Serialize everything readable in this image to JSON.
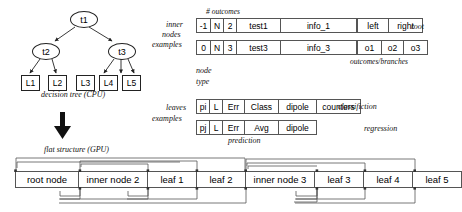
{
  "diagram": {
    "tree": {
      "caption": "decision tree (CPU)",
      "root": "t1",
      "inner": [
        "t2",
        "t3"
      ],
      "leaves": [
        "L1",
        "L2",
        "L3",
        "L4",
        "L5"
      ]
    },
    "transition_arrow": "down-arrow",
    "flat": {
      "caption": "flat structure (GPU)",
      "cells": [
        "root node",
        "inner node 2",
        "leaf 1",
        "leaf 2",
        "inner node 3",
        "leaf 3",
        "leaf 4",
        "leaf 5"
      ]
    },
    "records": {
      "header_outcomes": "# outcomes",
      "label_inner_nodes": [
        "inner",
        "nodes"
      ],
      "label_examples_top": "examples",
      "label_node_type": [
        "node",
        "type"
      ],
      "label_leaves": "leaves",
      "label_examples_bottom": "examples",
      "label_branches": "outcomes/branches",
      "label_prediction": "prediction",
      "inner_template": {
        "fields": [
          "-1",
          "N",
          "2",
          "test1",
          "info_1"
        ],
        "branches": [
          "left",
          "right"
        ],
        "annotation": "root"
      },
      "inner_example": {
        "fields": [
          "0",
          "N",
          "3",
          "test3",
          "info_3"
        ],
        "branches": [
          "o1",
          "o2",
          "o3"
        ],
        "annotation": ""
      },
      "leaf_classification": {
        "fields": [
          "pi",
          "L",
          "Err",
          "Class",
          "dipole",
          "counters"
        ],
        "annotation": "classifiction"
      },
      "leaf_regression": {
        "fields": [
          "pj",
          "L",
          "Err",
          "Avg",
          "dipole"
        ],
        "annotation": "regression"
      }
    }
  }
}
